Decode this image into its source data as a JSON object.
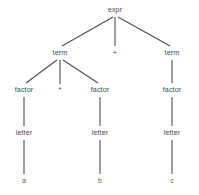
{
  "figure": {
    "kind": "parse-tree",
    "caption": "",
    "background_color": "#ffffff",
    "edge_color": "#4d4d4b",
    "text_color": "#4a4a48",
    "edge_width": 1.1
  },
  "nodes": [
    {
      "id": "expr",
      "label": "expr",
      "x": 115,
      "y": 10,
      "level": 0,
      "kind": "nonterminal"
    },
    {
      "id": "term1",
      "label": "term",
      "x": 60,
      "y": 53,
      "level": 1,
      "kind": "nonterminal"
    },
    {
      "id": "plus",
      "label": "+",
      "x": 115,
      "y": 53,
      "level": 1,
      "kind": "operator"
    },
    {
      "id": "term2",
      "label": "term",
      "x": 172,
      "y": 53,
      "level": 1,
      "kind": "nonterminal"
    },
    {
      "id": "factor1",
      "label": "factor",
      "x": 24,
      "y": 90,
      "level": 2,
      "kind": "nonterminal"
    },
    {
      "id": "star",
      "label": "*",
      "x": 60,
      "y": 90,
      "level": 2,
      "kind": "operator"
    },
    {
      "id": "factor2",
      "label": "factor",
      "x": 100,
      "y": 90,
      "level": 2,
      "kind": "nonterminal"
    },
    {
      "id": "factor3",
      "label": "factor",
      "x": 172,
      "y": 90,
      "level": 2,
      "kind": "nonterminal"
    },
    {
      "id": "letter1",
      "label": "letter",
      "x": 24,
      "y": 133,
      "level": 3,
      "kind": "nonterminal"
    },
    {
      "id": "letter2",
      "label": "letter",
      "x": 100,
      "y": 133,
      "level": 3,
      "kind": "nonterminal"
    },
    {
      "id": "letter3",
      "label": "letter",
      "x": 172,
      "y": 133,
      "level": 3,
      "kind": "nonterminal"
    },
    {
      "id": "a",
      "label": "a",
      "x": 24,
      "y": 180,
      "level": 4,
      "kind": "terminal"
    },
    {
      "id": "b",
      "label": "b",
      "x": 100,
      "y": 180,
      "level": 4,
      "kind": "terminal"
    },
    {
      "id": "c",
      "label": "c",
      "x": 172,
      "y": 180,
      "level": 4,
      "kind": "terminal"
    }
  ],
  "edges": [
    {
      "from": "expr",
      "to": "term1",
      "x1": 113,
      "y1": 17,
      "x2": 62,
      "y2": 46
    },
    {
      "from": "expr",
      "to": "plus",
      "x1": 115,
      "y1": 17,
      "x2": 115,
      "y2": 46
    },
    {
      "from": "expr",
      "to": "term2",
      "x1": 118,
      "y1": 17,
      "x2": 170,
      "y2": 46
    },
    {
      "from": "term1",
      "to": "factor1",
      "x1": 57,
      "y1": 60,
      "x2": 26,
      "y2": 83
    },
    {
      "from": "term1",
      "to": "star",
      "x1": 60,
      "y1": 60,
      "x2": 60,
      "y2": 84
    },
    {
      "from": "term1",
      "to": "factor2",
      "x1": 63,
      "y1": 60,
      "x2": 98,
      "y2": 83
    },
    {
      "from": "term2",
      "to": "factor3",
      "x1": 172,
      "y1": 60,
      "x2": 172,
      "y2": 83
    },
    {
      "from": "factor1",
      "to": "letter1",
      "x1": 24,
      "y1": 97,
      "x2": 24,
      "y2": 126
    },
    {
      "from": "factor2",
      "to": "letter2",
      "x1": 100,
      "y1": 97,
      "x2": 100,
      "y2": 126
    },
    {
      "from": "factor3",
      "to": "letter3",
      "x1": 172,
      "y1": 97,
      "x2": 172,
      "y2": 126
    },
    {
      "from": "letter1",
      "to": "a",
      "x1": 24,
      "y1": 140,
      "x2": 24,
      "y2": 174
    },
    {
      "from": "letter2",
      "to": "b",
      "x1": 100,
      "y1": 140,
      "x2": 100,
      "y2": 174
    },
    {
      "from": "letter3",
      "to": "c",
      "x1": 172,
      "y1": 140,
      "x2": 172,
      "y2": 174
    }
  ]
}
